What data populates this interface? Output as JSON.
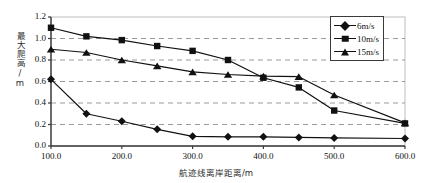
{
  "chart_data": {
    "type": "line",
    "title": "",
    "xlabel": "航迹线离岸距离/m",
    "ylabel": "最大爬高/m",
    "xlim": [
      100.0,
      600.0
    ],
    "ylim": [
      0.0,
      1.2
    ],
    "xticks": [
      "100.0",
      "200.0",
      "300.0",
      "400.0",
      "500.0",
      "600.0"
    ],
    "xtick_values": [
      100,
      200,
      300,
      400,
      500,
      600
    ],
    "yticks": [
      "0.0",
      "0.2",
      "0.4",
      "0.6",
      "0.8",
      "1.0",
      "1.2"
    ],
    "ytick_values": [
      0.0,
      0.2,
      0.4,
      0.6,
      0.8,
      1.0,
      1.2
    ],
    "grid": "horizontal-dashed",
    "legend_position": "top-right",
    "x": [
      100,
      150,
      200,
      250,
      300,
      350,
      400,
      450,
      500,
      600
    ],
    "series": [
      {
        "name": "6m/s",
        "marker": "diamond",
        "values": [
          0.62,
          0.3,
          0.23,
          0.155,
          0.09,
          0.085,
          0.085,
          0.08,
          0.075,
          0.07
        ]
      },
      {
        "name": "10m/s",
        "marker": "square",
        "values": [
          1.1,
          1.02,
          0.985,
          0.93,
          0.885,
          0.8,
          0.635,
          0.545,
          0.33,
          0.21
        ]
      },
      {
        "name": "15m/s",
        "marker": "triangle",
        "values": [
          0.9,
          0.87,
          0.8,
          0.745,
          0.69,
          0.665,
          0.65,
          0.645,
          0.475,
          0.215
        ]
      }
    ]
  },
  "legend": {
    "items": [
      {
        "label": "6m/s",
        "marker": "diamond"
      },
      {
        "label": "10m/s",
        "marker": "square"
      },
      {
        "label": "15m/s",
        "marker": "triangle"
      }
    ]
  },
  "colors": {
    "line": "#111111",
    "marker": "#111111",
    "grid": "#9a9a9a",
    "axis": "#3a3a3a",
    "background": "#ffffff"
  }
}
